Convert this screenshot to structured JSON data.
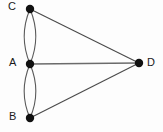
{
  "diagram": {
    "type": "graph",
    "background_color": "#fdfdfd",
    "node_color": "#111111",
    "edge_color": "#4a4a4a",
    "nodes": [
      {
        "id": "C",
        "label": "C",
        "x": 30,
        "y": 9,
        "radius": 4.2,
        "label_position": "left"
      },
      {
        "id": "A",
        "label": "A",
        "x": 30,
        "y": 64,
        "radius": 4.2,
        "label_position": "left"
      },
      {
        "id": "B",
        "label": "B",
        "x": 30,
        "y": 118,
        "radius": 4.2,
        "label_position": "left"
      },
      {
        "id": "D",
        "label": "D",
        "x": 139,
        "y": 63,
        "radius": 4.2,
        "label_position": "right"
      }
    ],
    "edges": [
      {
        "from": "C",
        "to": "A",
        "style": "curve",
        "bow": -6,
        "name": "edge-c-a-left"
      },
      {
        "from": "C",
        "to": "A",
        "style": "curve",
        "bow": 6,
        "name": "edge-c-a-right"
      },
      {
        "from": "A",
        "to": "B",
        "style": "curve",
        "bow": -6,
        "name": "edge-a-b-left"
      },
      {
        "from": "A",
        "to": "B",
        "style": "curve",
        "bow": 6,
        "name": "edge-a-b-right"
      },
      {
        "from": "C",
        "to": "D",
        "style": "straight",
        "bow": 0,
        "name": "edge-c-d"
      },
      {
        "from": "A",
        "to": "D",
        "style": "horizontal",
        "bow": 0,
        "name": "edge-a-d"
      },
      {
        "from": "B",
        "to": "D",
        "style": "straight",
        "bow": 0,
        "name": "edge-b-d"
      }
    ],
    "paths": {
      "edge_c_a_left": "M 30 9 C 22 28, 22 45, 30 64",
      "edge_c_a_right": "M 30 9 C 38 28, 38 45, 30 64",
      "edge_a_b_left": "M 30 64 C 22 83, 22 100, 30 118",
      "edge_a_b_right": "M 30 64 C 38 83, 38 100, 30 118",
      "edge_c_d": "M 30 9 L 139 63",
      "edge_a_d": "M 30 64 L 139 63",
      "edge_b_d": "M 30 118 L 139 63"
    }
  }
}
